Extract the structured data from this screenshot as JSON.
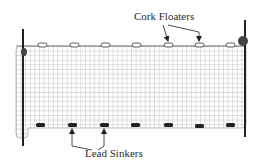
{
  "diagram": {
    "labels": {
      "floaters": "Cork Floaters",
      "sinkers": "Lead Sinkers"
    },
    "colors": {
      "net": "#9a9a9a",
      "pole": "#222222",
      "floater_fill": "#ffffff",
      "floater_stroke": "#333333",
      "sinker": "#222222",
      "text": "#2a2a2a"
    },
    "floater_count": 7,
    "sinker_count": 7
  }
}
